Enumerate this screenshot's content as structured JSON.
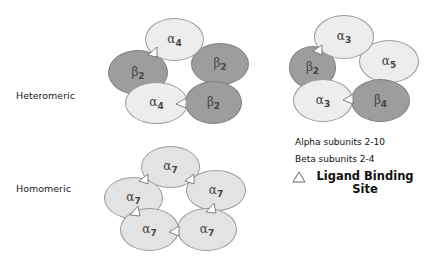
{
  "labels": {
    "heteromeric": "Heteromeric",
    "homomeric": "Homomeric"
  },
  "legend": {
    "alpha": "Alpha subunits 2-10",
    "beta": "Beta subunits 2-4",
    "ligand_line1": "Ligand Binding",
    "ligand_line2": "Site",
    "icon": "triangle-icon"
  },
  "colors": {
    "beta_fill": "#9d9d9d",
    "alpha_fill": "#ededed",
    "alpha7_fill": "#e3e3e3"
  },
  "complexes": {
    "a4b2": {
      "s0": {
        "greek": "α",
        "num": "4"
      },
      "s1": {
        "greek": "β",
        "num": "2"
      },
      "s2": {
        "greek": "β",
        "num": "2"
      },
      "s3": {
        "greek": "α",
        "num": "4"
      },
      "s4": {
        "greek": "β",
        "num": "2"
      }
    },
    "a3b": {
      "s0": {
        "greek": "α",
        "num": "3"
      },
      "s1": {
        "greek": "β",
        "num": "2"
      },
      "s2": {
        "greek": "α",
        "num": "5"
      },
      "s3": {
        "greek": "α",
        "num": "3"
      },
      "s4": {
        "greek": "β",
        "num": "4"
      }
    },
    "a7": {
      "s0": {
        "greek": "α",
        "num": "7"
      },
      "s1": {
        "greek": "α",
        "num": "7"
      },
      "s2": {
        "greek": "α",
        "num": "7"
      },
      "s3": {
        "greek": "α",
        "num": "7"
      },
      "s4": {
        "greek": "α",
        "num": "7"
      }
    }
  }
}
